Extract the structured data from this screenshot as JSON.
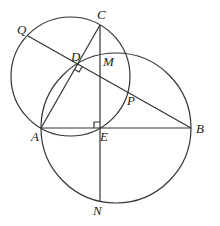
{
  "diagram": {
    "type": "geometry",
    "points": {
      "A": {
        "label": "A",
        "x": 41,
        "y": 128
      },
      "B": {
        "label": "B",
        "x": 191,
        "y": 128
      },
      "C": {
        "label": "C",
        "x": 100,
        "y": 25
      },
      "D": {
        "label": "D",
        "x": 77,
        "y": 64
      },
      "E": {
        "label": "E",
        "x": 100,
        "y": 128
      },
      "M": {
        "label": "M",
        "x": 100,
        "y": 55
      },
      "N": {
        "label": "N",
        "x": 100,
        "y": 202
      },
      "P": {
        "label": "P",
        "x": 129,
        "y": 90
      },
      "Q": {
        "label": "Q",
        "x": 28,
        "y": 36
      }
    },
    "circles": [
      {
        "name": "circle-ACE",
        "cx": 70.5,
        "cy": 76.5,
        "r": 59.5
      },
      {
        "name": "circle-ABN",
        "cx": 116,
        "cy": 128,
        "r": 75
      }
    ],
    "segments": [
      "AB",
      "AC",
      "CN",
      "QB"
    ],
    "right_angles": [
      "D",
      "E"
    ]
  }
}
